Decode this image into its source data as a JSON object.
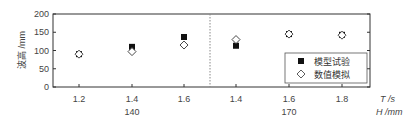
{
  "chart_data": {
    "type": "scatter",
    "title": "",
    "ylabel": "波高 /mm",
    "xlabel_primary": "T /s",
    "xlabel_secondary": "H /mm",
    "ylim": [
      0,
      200
    ],
    "yticks": [
      "0",
      "50",
      "100",
      "150",
      "200"
    ],
    "groups": [
      {
        "label": "140",
        "categories": [
          "1.2",
          "1.4",
          "1.6"
        ]
      },
      {
        "label": "170",
        "categories": [
          "1.4",
          "1.6",
          "1.8"
        ]
      }
    ],
    "categories": [
      "1.2",
      "1.4",
      "1.6",
      "1.4",
      "1.6",
      "1.8"
    ],
    "series": [
      {
        "name": "模型试验",
        "marker": "filled-square",
        "values": [
          90,
          110,
          137,
          113,
          145,
          143
        ]
      },
      {
        "name": "数值模拟",
        "marker": "open-diamond",
        "values": [
          90,
          97,
          115,
          130,
          145,
          142
        ]
      }
    ],
    "grid": false,
    "legend_position": "lower-right",
    "divider": "dotted vertical line between H=140 and H=170 groups"
  },
  "legend": {
    "items": [
      {
        "label": "模型试验",
        "icon": "filled-square-icon"
      },
      {
        "label": "数值模拟",
        "icon": "open-diamond-icon"
      }
    ]
  },
  "colors": {
    "axis": "#333333",
    "marker_fill": "#111111",
    "divider": "#888888"
  }
}
